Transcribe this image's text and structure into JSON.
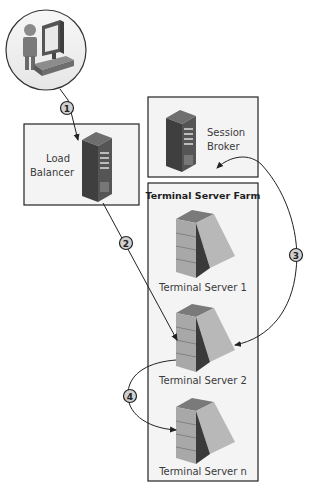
{
  "diagram": {
    "client": {
      "name": "Client computer and user"
    },
    "load_balancer": {
      "line1": "Load",
      "line2": "Balancer"
    },
    "session_broker": {
      "line1": "Session",
      "line2": "Broker"
    },
    "farm": {
      "title": "Terminal Server Farm",
      "servers": [
        {
          "label": "Terminal Server 1"
        },
        {
          "label": "Terminal Server 2"
        },
        {
          "label": "Terminal Server n"
        }
      ]
    },
    "steps": [
      {
        "number": "1",
        "from": "Client",
        "to": "Load Balancer"
      },
      {
        "number": "2",
        "from": "Load Balancer",
        "to": "Terminal Server 2"
      },
      {
        "number": "3",
        "from": "Session Broker",
        "to": "Terminal Server 2"
      },
      {
        "number": "4",
        "from": "Terminal Server 2",
        "to": "Terminal Server n"
      }
    ]
  }
}
